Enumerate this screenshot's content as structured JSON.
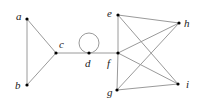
{
  "diagram": {
    "type": "graph",
    "nodes": [
      {
        "id": "a",
        "label": "a",
        "x": 27,
        "y": 19,
        "lx": 16,
        "ly": 20
      },
      {
        "id": "b",
        "label": "b",
        "x": 27,
        "y": 85,
        "lx": 15,
        "ly": 89
      },
      {
        "id": "c",
        "label": "c",
        "x": 56,
        "y": 53,
        "lx": 59,
        "ly": 48
      },
      {
        "id": "d",
        "label": "d",
        "x": 89,
        "y": 53,
        "lx": 85,
        "ly": 67
      },
      {
        "id": "e",
        "label": "e",
        "x": 118,
        "y": 15,
        "lx": 107,
        "ly": 17
      },
      {
        "id": "f",
        "label": "f",
        "x": 118,
        "y": 53,
        "lx": 107,
        "ly": 67
      },
      {
        "id": "g",
        "label": "g",
        "x": 117,
        "y": 90,
        "lx": 107,
        "ly": 96
      },
      {
        "id": "h",
        "label": "h",
        "x": 179,
        "y": 23,
        "lx": 184,
        "ly": 27
      },
      {
        "id": "i",
        "label": "i",
        "x": 178,
        "y": 84,
        "lx": 186,
        "ly": 88
      }
    ],
    "edges": [
      [
        "a",
        "b"
      ],
      [
        "a",
        "c"
      ],
      [
        "b",
        "c"
      ],
      [
        "c",
        "d"
      ],
      [
        "d",
        "f"
      ],
      [
        "e",
        "f"
      ],
      [
        "f",
        "g"
      ],
      [
        "e",
        "h"
      ],
      [
        "e",
        "i"
      ],
      [
        "f",
        "h"
      ],
      [
        "f",
        "i"
      ],
      [
        "g",
        "h"
      ],
      [
        "g",
        "i"
      ]
    ],
    "loops": [
      {
        "node": "d",
        "cx": 89,
        "cy": 43,
        "r": 10
      }
    ]
  }
}
